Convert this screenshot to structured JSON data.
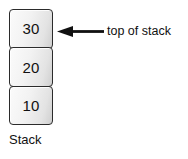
{
  "figure": {
    "kind": "stack-data-structure-diagram",
    "background_color": "#ffffff",
    "text_color": "#111111"
  },
  "stack": {
    "caption": "Stack",
    "border_color": "#2b2b2b",
    "fill_color": "#f0f0f0",
    "cells": [
      {
        "value": "30",
        "position": "top"
      },
      {
        "value": "20",
        "position": "middle"
      },
      {
        "value": "10",
        "position": "bottom"
      }
    ]
  },
  "annotation": {
    "icon": "arrow-left-icon",
    "label": "top of stack",
    "points_to": "30",
    "color": "#111111"
  }
}
